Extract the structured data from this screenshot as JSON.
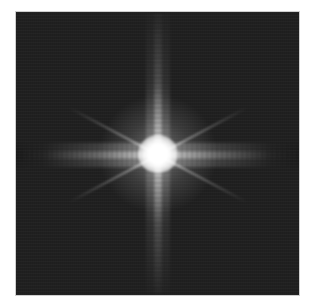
{
  "image": {
    "description": "Fourier transform magnitude spectrum: bright central star with vertical and horizontal streaks and faint diagonal rays on a dark noisy background",
    "colors": {
      "background": "#202020",
      "highlight": "#ffffff",
      "page": "#ffffff"
    }
  }
}
